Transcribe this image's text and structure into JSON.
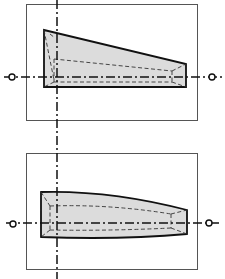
{
  "diagram": {
    "colors": {
      "background": "#ffffff",
      "frame": "#555555",
      "outline": "#111111",
      "fill": "#dcdcdc",
      "hidden_lines": "#333333",
      "axis": "#111111"
    },
    "vertical_axis_x": 57,
    "panels": [
      {
        "id": "top",
        "frame": {
          "x": 26,
          "y": 4,
          "w": 172,
          "h": 117
        },
        "axis_y": 77,
        "shape": "trapezoid (straight tapered top)"
      },
      {
        "id": "bottom",
        "frame": {
          "x": 26,
          "y": 153,
          "w": 172,
          "h": 117
        },
        "axis_y": 223,
        "shape": "curved tapered body"
      }
    ]
  }
}
